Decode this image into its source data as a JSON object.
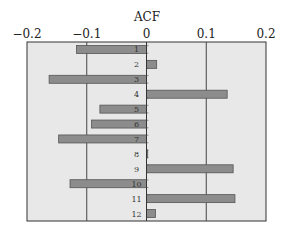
{
  "chart_data": {
    "type": "bar",
    "orientation": "horizontal",
    "title": "ACF",
    "xlabel": "ACF",
    "ylabel": "",
    "xlim": [
      -0.2,
      0.2
    ],
    "xticks": [
      -0.2,
      -0.1,
      0,
      0.1,
      0.2
    ],
    "xtick_labels": [
      "−0.2",
      "−0.1",
      "0",
      "0.1",
      "0.2"
    ],
    "gridlines_x": [
      -0.1,
      0.1
    ],
    "grid": true,
    "legend": null,
    "categories": [
      "1",
      "2",
      "3",
      "4",
      "5",
      "6",
      "7",
      "8",
      "9",
      "10",
      "11",
      "12"
    ],
    "values": [
      -0.117,
      0.017,
      -0.163,
      0.135,
      -0.078,
      -0.092,
      -0.147,
      0.002,
      0.145,
      -0.128,
      0.148,
      0.015
    ],
    "colors": {
      "plot_background": "#e8e8e8",
      "bar_fill": "#8c8c8c",
      "bar_stroke": "#555555",
      "gridline": "#444444",
      "axis": "#333333"
    }
  }
}
